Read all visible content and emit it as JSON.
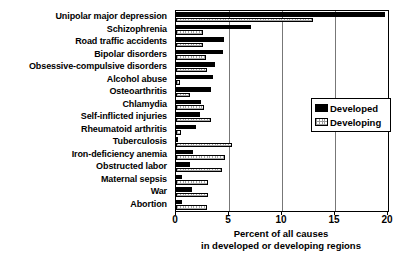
{
  "chart_data": {
    "type": "bar",
    "orientation": "horizontal",
    "title": "",
    "xlabel_lines": [
      "Percent of all causes",
      "in developed or developing regions"
    ],
    "ylabel": "",
    "xlim": [
      0,
      20
    ],
    "xticks": [
      0,
      5,
      10,
      15,
      20
    ],
    "xticklabels": [
      "0",
      "5",
      "10",
      "15",
      "20"
    ],
    "grid": "vertical gridlines at x ticks",
    "legend": {
      "position": "inside-right-upper",
      "entries": [
        {
          "name": "Developed",
          "color": "#000000",
          "style": "solid-black"
        },
        {
          "name": "Developing",
          "color": "#ffffff",
          "style": "white-stippled-outline"
        }
      ]
    },
    "categories": [
      "Unipolar major depression",
      "Schizophrenia",
      "Road traffic accidents",
      "Bipolar disorders",
      "Obsessive-compulsive disorders",
      "Alcohol abuse",
      "Osteoarthritis",
      "Chlamydia",
      "Self-inflicted injuries",
      "Rheumatoid arthritis",
      "Tuberculosis",
      "Iron-deficiency anemia",
      "Obstructed labor",
      "Maternal sepsis",
      "War",
      "Abortion"
    ],
    "series": [
      {
        "name": "Developed",
        "values": [
          19.7,
          7.1,
          4.5,
          4.4,
          3.7,
          3.5,
          3.3,
          2.4,
          2.3,
          1.9,
          0.2,
          1.6,
          1.3,
          0.6,
          1.5,
          0.6
        ]
      },
      {
        "name": "Developing",
        "values": [
          12.9,
          2.5,
          2.5,
          2.8,
          2.9,
          0.4,
          1.3,
          2.6,
          3.3,
          0.5,
          5.3,
          4.6,
          4.3,
          3.0,
          3.0,
          2.9
        ]
      }
    ]
  },
  "axis": {
    "caption_line1": "Percent of all causes",
    "caption_line2": "in developed or developing regions"
  }
}
